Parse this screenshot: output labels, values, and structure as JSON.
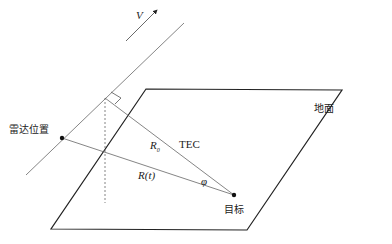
{
  "diagram": {
    "labels": {
      "velocity": "V",
      "ground": "地面",
      "radar_position": "雷达位置",
      "tec": "TEC",
      "r0": "R",
      "r0_sub": "0",
      "rt": "R(t)",
      "angle": "φ",
      "target": "目标"
    },
    "colors": {
      "line": "#333333",
      "thin_line": "#666666",
      "background": "#ffffff"
    }
  }
}
